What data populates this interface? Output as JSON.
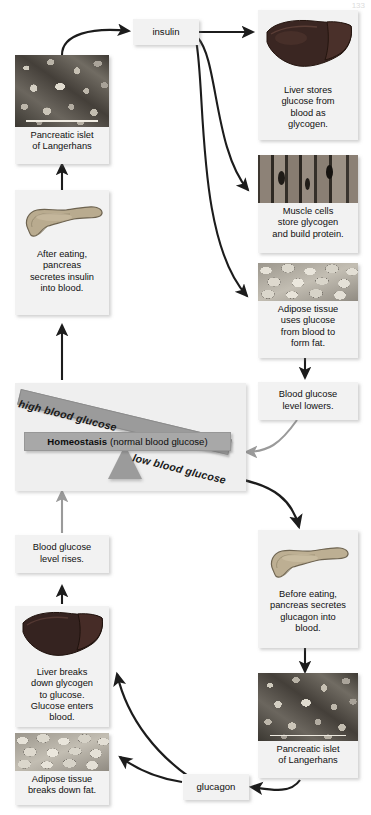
{
  "page": {
    "number": "133"
  },
  "diagram": {
    "hormones": {
      "insulin_label": "insulin",
      "glucagon_label": "glucagon"
    },
    "homeostasis": {
      "center_bold": "Homeostasis",
      "center_rest": "(normal blood glucose)",
      "high_label": "high blood glucose",
      "low_label": "low blood glucose"
    },
    "insulin_pathway": [
      {
        "id": "islet-top",
        "image": "islet-micrograph",
        "caption": "Pancreatic islet\nof Langerhans"
      },
      {
        "id": "pancreas-after-eating",
        "image": "pancreas-organ",
        "caption": "After eating,\npancreas\nsecretes insulin\ninto blood."
      },
      {
        "id": "liver-stores",
        "image": "liver-organ",
        "caption": "Liver stores\nglucose from\nblood as\nglycogen."
      },
      {
        "id": "muscle-stores",
        "image": "muscle-fibers",
        "caption": "Muscle cells\nstore glycogen\nand build protein."
      },
      {
        "id": "adipose-forms-fat",
        "image": "adipose-tissue",
        "caption": "Adipose tissue\nuses glucose\nfrom blood to\nform fat."
      },
      {
        "id": "glucose-lowers",
        "image": null,
        "caption": "Blood glucose\nlevel lowers."
      }
    ],
    "glucagon_pathway": [
      {
        "id": "pancreas-before-eating",
        "image": "pancreas-organ",
        "caption": "Before eating,\npancreas secretes\nglucagon into\nblood."
      },
      {
        "id": "islet-bottom",
        "image": "islet-micrograph",
        "caption": "Pancreatic islet\nof Langerhans"
      },
      {
        "id": "liver-breaks-down",
        "image": "liver-organ",
        "caption": "Liver breaks\ndown glycogen\nto glucose.\nGlucose enters\nblood."
      },
      {
        "id": "adipose-breaks-fat",
        "image": "adipose-tissue",
        "caption": "Adipose tissue\nbreaks down fat."
      },
      {
        "id": "glucose-rises",
        "image": null,
        "caption": "Blood glucose\nlevel rises."
      }
    ],
    "colors": {
      "panel_bg": "#f2f2f2",
      "beam_gray": "#9b9b9b",
      "bar_gray": "#a8a8a8",
      "arrow_dark": "#1c1c1c",
      "arrow_light": "#9a9a9a",
      "page_bg": "#ffffff"
    }
  }
}
